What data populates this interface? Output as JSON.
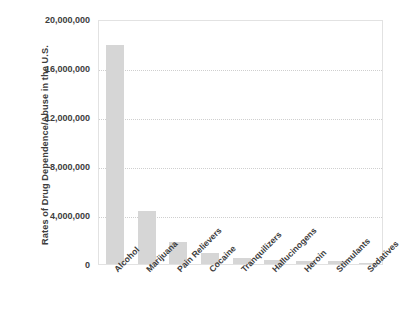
{
  "chart_data": {
    "type": "bar",
    "title": "",
    "xlabel": "",
    "ylabel": "Rates of Drug Dependence/Abuse in the U.S.",
    "categories": [
      "Alcohol",
      "Marijuana",
      "Pain Relievers",
      "Cocaine",
      "Tranquilizers",
      "Hallucinogens",
      "Heroin",
      "Stimulants",
      "Sedatives"
    ],
    "values": [
      17900000,
      4300000,
      1800000,
      900000,
      500000,
      300000,
      280000,
      270000,
      100000
    ],
    "ylim": [
      0,
      20000000
    ],
    "ytick_values": [
      0,
      4000000,
      8000000,
      12000000,
      16000000,
      20000000
    ],
    "ytick_labels": [
      "0",
      "4,000,000",
      "8,000,000",
      "12,000,000",
      "16,000,000",
      "20,000,000"
    ],
    "grid": true,
    "grid_axis": "y",
    "legend": false,
    "legend_position": "none",
    "bar_color": "#d6d6d6",
    "grid_color": "#cfcfcf",
    "axis_border_color": "#e2e2e2",
    "text_color": "#3d3d3d",
    "background_color": "#ffffff",
    "xtick_rotation_deg": -45
  }
}
